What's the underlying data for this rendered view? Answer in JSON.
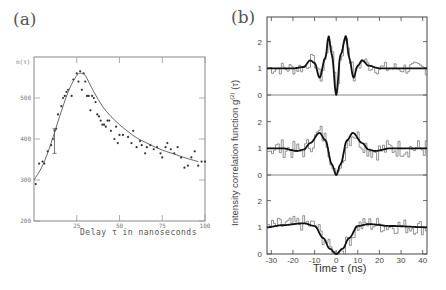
{
  "chart_data": [
    {
      "panel": "(a)",
      "type": "scatter",
      "title": "",
      "xlabel": "Delay τ in nanoseconds",
      "ylabel": "n(τ)",
      "xlim": [
        0,
        100
      ],
      "ylim": [
        200,
        600
      ],
      "xticks": [
        25,
        50,
        75,
        100
      ],
      "yticks": [
        200,
        300,
        400,
        500
      ],
      "grid": false,
      "series": [
        {
          "name": "data points",
          "type": "scatter",
          "x": [
            1,
            3,
            5,
            6,
            8,
            10,
            11,
            12,
            13,
            14,
            16,
            17,
            18,
            19,
            20,
            22,
            23,
            25,
            26,
            27,
            28,
            29,
            30,
            31,
            32,
            33,
            34,
            35,
            36,
            37,
            38,
            39,
            40,
            41,
            42,
            43,
            44,
            45,
            47,
            48,
            49,
            50,
            52,
            55,
            57,
            58,
            60,
            62,
            63,
            65,
            66,
            68,
            70,
            72,
            74,
            75,
            77,
            78,
            80,
            82,
            84,
            86,
            88,
            90,
            92,
            94,
            96,
            98,
            100
          ],
          "y": [
            290,
            340,
            345,
            340,
            370,
            385,
            400,
            420,
            425,
            460,
            480,
            500,
            505,
            515,
            520,
            505,
            545,
            560,
            540,
            565,
            520,
            560,
            540,
            505,
            505,
            470,
            505,
            500,
            490,
            460,
            455,
            445,
            435,
            435,
            430,
            445,
            445,
            420,
            400,
            430,
            390,
            410,
            410,
            405,
            390,
            420,
            380,
            395,
            385,
            365,
            380,
            385,
            375,
            380,
            365,
            355,
            380,
            390,
            375,
            365,
            380,
            355,
            330,
            335,
            355,
            370,
            335,
            345,
            345
          ]
        },
        {
          "name": "fitted curve",
          "type": "line",
          "x": [
            0,
            5,
            10,
            15,
            20,
            25,
            28,
            30,
            35,
            40,
            45,
            50,
            55,
            60,
            65,
            70,
            75,
            80,
            85,
            90,
            96
          ],
          "y": [
            300,
            335,
            390,
            455,
            515,
            555,
            560,
            555,
            515,
            480,
            455,
            435,
            418,
            403,
            392,
            382,
            373,
            366,
            359,
            352,
            345
          ]
        }
      ],
      "annotations": [
        "error bar near τ≈12 ns spanning ~370–420"
      ]
    },
    {
      "panel": "(b)",
      "type": "line",
      "title": "",
      "xlabel": "Time τ (ns)",
      "ylabel": "Intensity correlation function g(2)(τ)",
      "xlim": [
        -32,
        42
      ],
      "xticks": [
        -30,
        -20,
        -10,
        0,
        10,
        20,
        30,
        40
      ],
      "grid": false,
      "subpanels": [
        {
          "name": "top",
          "ylim": [
            0,
            2.9
          ],
          "yticks": [
            0,
            1,
            2
          ],
          "fit": {
            "x": [
              -32,
              -20,
              -15,
              -12,
              -10,
              -7.7,
              -5,
              -3.5,
              -2,
              0,
              2,
              4.5,
              6,
              8,
              10,
              12,
              15,
              20,
              30,
              42
            ],
            "y": [
              1.0,
              1.0,
              1.05,
              1.3,
              1.2,
              0.65,
              1.4,
              2.2,
              1.5,
              0.0,
              1.5,
              2.2,
              1.4,
              0.65,
              1.1,
              1.3,
              1.1,
              1.0,
              1.0,
              1.0
            ]
          },
          "data_noise_amplitude": 0.25,
          "peak_max_observed": 2.75
        },
        {
          "name": "middle",
          "ylim": [
            0,
            2.9
          ],
          "yticks": [
            0,
            1,
            2
          ],
          "fit": {
            "x": [
              -32,
              -25,
              -18,
              -15,
              -12,
              -7.7,
              -5,
              -2,
              0,
              2,
              5,
              7.7,
              12,
              15,
              18,
              25,
              42
            ],
            "y": [
              1.0,
              1.0,
              0.9,
              0.95,
              1.2,
              1.58,
              1.3,
              0.4,
              0.0,
              0.4,
              1.3,
              1.58,
              1.2,
              0.95,
              0.9,
              1.0,
              1.0
            ]
          },
          "data_noise_amplitude": 0.35,
          "peak_max_observed": 1.95
        },
        {
          "name": "bottom",
          "ylim": [
            0,
            2.9
          ],
          "yticks": [
            0,
            1,
            2
          ],
          "fit": {
            "x": [
              -32,
              -25,
              -15,
              -10,
              -6,
              -3,
              0,
              3,
              6,
              10,
              15,
              25,
              42
            ],
            "y": [
              1.0,
              1.08,
              1.15,
              1.05,
              0.6,
              0.2,
              0.0,
              0.2,
              0.6,
              1.05,
              1.12,
              1.05,
              1.0
            ]
          },
          "data_noise_amplitude": 0.3,
          "peak_max_observed": 1.6
        }
      ]
    }
  ],
  "labels": {
    "panel_a": "(a)",
    "panel_b": "(b)",
    "a_ylabel": "n(τ)",
    "a_xlabel": "Delay  τ  in  nanoseconds",
    "a_yticks": [
      "200",
      "300",
      "400",
      "500"
    ],
    "a_xticks": [
      "25",
      "50",
      "75",
      "100"
    ],
    "b_xlabel": "Time  τ  (ns)",
    "b_ylabel": "Intensity correlation function g",
    "b_ylabel_sup": "(2)",
    "b_ylabel_tail": " (τ)",
    "b_yticks": [
      "0",
      "1",
      "2"
    ],
    "b_xticks": [
      "-30",
      "-20",
      "-10",
      "0",
      "10",
      "20",
      "30",
      "40"
    ]
  }
}
